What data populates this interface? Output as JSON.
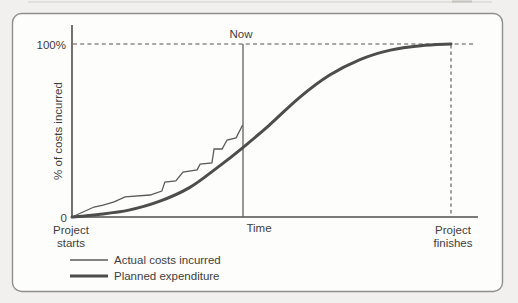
{
  "colors": {
    "line": "#4d4d4d",
    "thin_line": "#5a5a5a",
    "text": "#3e3e3e",
    "frame": "#8f8e8b",
    "page_background": "#f1f0ee",
    "panel_background": "#fdfdfc"
  },
  "labels": {
    "y_max_tick": "100%",
    "y_min_tick": "0",
    "y_axis_title": "% of costs incurred",
    "x_axis_title": "Time",
    "now_marker": "Now",
    "x_start_line1": "Project",
    "x_start_line2": "starts",
    "x_end_line1": "Project",
    "x_end_line2": "finishes"
  },
  "legend": {
    "items": [
      {
        "label": "Actual costs incurred",
        "line_weight": "thin"
      },
      {
        "label": "Planned expenditure",
        "line_weight": "thick"
      }
    ]
  },
  "chart_data": {
    "type": "line",
    "title": "",
    "xlabel": "Time",
    "ylabel": "% of costs incurred",
    "xlim": [
      0,
      100
    ],
    "ylim": [
      0,
      100
    ],
    "grid": false,
    "legend_position": "bottom-left",
    "y_tick_labels": [
      "0",
      "100%"
    ],
    "x_axis_annotations": {
      "start": "Project starts",
      "end": "Project finishes",
      "now_label": "Now",
      "now_x": 45
    },
    "reference_lines": [
      {
        "type": "horizontal-dashed",
        "y": 100
      },
      {
        "type": "vertical-dashed",
        "x": 100
      },
      {
        "type": "vertical-solid",
        "x": 45,
        "label": "Now"
      }
    ],
    "series": [
      {
        "name": "Actual costs incurred",
        "style": "thin",
        "smooth": false,
        "ends_at_now": true,
        "points": [
          [
            0,
            0
          ],
          [
            5.8,
            5.8
          ],
          [
            8.2,
            6.9
          ],
          [
            11.1,
            8.7
          ],
          [
            14,
            11.6
          ],
          [
            20.6,
            12.7
          ],
          [
            23.7,
            15
          ],
          [
            24.5,
            20.2
          ],
          [
            27.4,
            20.8
          ],
          [
            29.3,
            26
          ],
          [
            33,
            27.2
          ],
          [
            33.8,
            30.6
          ],
          [
            36.9,
            31.2
          ],
          [
            37.5,
            39.3
          ],
          [
            39.6,
            39.3
          ],
          [
            40.9,
            44.5
          ],
          [
            43.3,
            45.7
          ],
          [
            45,
            53.2
          ]
        ]
      },
      {
        "name": "Planned expenditure",
        "style": "thick",
        "smooth": true,
        "ends_at_now": false,
        "points": [
          [
            0,
            0
          ],
          [
            7,
            1.5
          ],
          [
            15,
            4
          ],
          [
            23,
            9
          ],
          [
            31,
            17
          ],
          [
            38,
            28
          ],
          [
            45,
            40
          ],
          [
            52,
            53
          ],
          [
            60,
            69
          ],
          [
            68,
            82
          ],
          [
            76,
            91
          ],
          [
            84,
            96.5
          ],
          [
            92,
            99
          ],
          [
            100,
            100
          ]
        ]
      }
    ]
  }
}
